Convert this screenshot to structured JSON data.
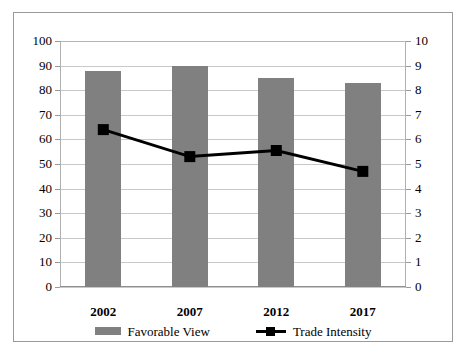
{
  "chart_data": {
    "type": "bar",
    "title": "",
    "subtitle": "",
    "xlabel": "",
    "ylabel": "",
    "categories": [
      "2002",
      "2007",
      "2012",
      "2017"
    ],
    "grid": true,
    "legend_position": "bottom",
    "axes": {
      "left": {
        "label": "",
        "min": 0,
        "max": 100,
        "step": 10,
        "ticks": [
          "0",
          "10",
          "20",
          "30",
          "40",
          "50",
          "60",
          "70",
          "80",
          "90",
          "100"
        ],
        "tick_values": [
          0,
          10,
          20,
          30,
          40,
          50,
          60,
          70,
          80,
          90,
          100
        ]
      },
      "right": {
        "label": "",
        "min": 0,
        "max": 10,
        "step": 1,
        "ticks": [
          "0",
          "1",
          "2",
          "3",
          "4",
          "5",
          "6",
          "7",
          "8",
          "9",
          "10"
        ],
        "tick_values": [
          0,
          1,
          2,
          3,
          4,
          5,
          6,
          7,
          8,
          9,
          10
        ]
      }
    },
    "series": [
      {
        "name": "Favorable View",
        "type": "bar",
        "axis": "left",
        "color": "#808080",
        "values": [
          88,
          90,
          85,
          83
        ]
      },
      {
        "name": "Trade Intensity",
        "type": "line",
        "axis": "right",
        "color": "#000000",
        "marker": "square",
        "values": [
          6.4,
          5.3,
          5.55,
          4.7
        ]
      }
    ]
  },
  "legend": {
    "items": [
      {
        "label": "Favorable View",
        "swatch": "bar-swatch",
        "color": "#808080"
      },
      {
        "label": "Trade Intensity",
        "swatch": "line-marker-swatch",
        "color": "#000000"
      }
    ]
  },
  "colors": {
    "bar": "#808080",
    "line": "#000000",
    "grid": "#c9c9c9",
    "frame_border": "#9a9a9a",
    "background": "#ffffff"
  }
}
